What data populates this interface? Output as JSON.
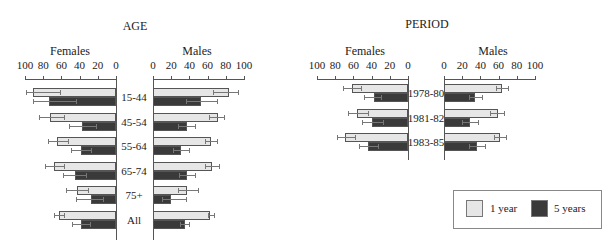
{
  "chart_data": [
    {
      "type": "bar",
      "orientation": "horizontal",
      "title": "AGE",
      "panels": [
        "Females",
        "Males"
      ],
      "categories": [
        "15-44",
        "45-54",
        "55-64",
        "65-74",
        "75+",
        "All"
      ],
      "xlim": [
        0,
        100
      ],
      "xticks": [
        0,
        20,
        40,
        60,
        80,
        100
      ],
      "series": [
        {
          "name": "1 year",
          "panel": "Females",
          "values": [
            91,
            73,
            65,
            68,
            43,
            63
          ],
          "err_low": [
            62,
            57,
            53,
            57,
            31,
            57
          ],
          "err_high": [
            99,
            85,
            75,
            78,
            55,
            68
          ]
        },
        {
          "name": "5 years",
          "panel": "Females",
          "values": [
            74,
            37,
            39,
            45,
            28,
            39
          ],
          "err_low": [
            44,
            22,
            28,
            33,
            14,
            29
          ],
          "err_high": [
            91,
            52,
            50,
            58,
            44,
            48
          ]
        },
        {
          "name": "1 year",
          "panel": "Males",
          "values": [
            83,
            71,
            64,
            65,
            37,
            63
          ],
          "err_low": [
            66,
            61,
            57,
            57,
            27,
            60
          ],
          "err_high": [
            93,
            78,
            70,
            72,
            49,
            67
          ]
        },
        {
          "name": "5 years",
          "panel": "Males",
          "values": [
            53,
            37,
            31,
            37,
            20,
            35
          ],
          "err_low": [
            36,
            28,
            22,
            29,
            10,
            30
          ],
          "err_high": [
            70,
            46,
            40,
            46,
            36,
            40
          ]
        }
      ]
    },
    {
      "type": "bar",
      "orientation": "horizontal",
      "title": "PERIOD",
      "panels": [
        "Females",
        "Males"
      ],
      "categories": [
        "1978-80",
        "1981-82",
        "1983-85"
      ],
      "xlim": [
        0,
        100
      ],
      "xticks": [
        0,
        20,
        40,
        60,
        80,
        100
      ],
      "series": [
        {
          "name": "1 year",
          "panel": "Females",
          "values": [
            61,
            56,
            69
          ],
          "err_low": [
            52,
            44,
            58
          ],
          "err_high": [
            71,
            66,
            78
          ]
        },
        {
          "name": "5 years",
          "panel": "Females",
          "values": [
            37,
            40,
            44
          ],
          "err_low": [
            30,
            28,
            33
          ],
          "err_high": [
            48,
            51,
            54
          ]
        },
        {
          "name": "1 year",
          "panel": "Males",
          "values": [
            64,
            59,
            62
          ],
          "err_low": [
            57,
            51,
            55
          ],
          "err_high": [
            70,
            66,
            68
          ]
        },
        {
          "name": "5 years",
          "panel": "Males",
          "values": [
            34,
            29,
            36
          ],
          "err_low": [
            27,
            20,
            28
          ],
          "err_high": [
            42,
            37,
            45
          ]
        }
      ]
    }
  ],
  "labels": {
    "age_title": "AGE",
    "period_title": "PERIOD",
    "females": "Females",
    "males": "Males",
    "ticks_female": [
      "100",
      "80",
      "60",
      "40",
      "20",
      "0"
    ],
    "ticks_male": [
      "0",
      "20",
      "40",
      "60",
      "80",
      "100"
    ]
  },
  "legend": {
    "items": [
      {
        "label": "1 year",
        "color": "#e6e6e6"
      },
      {
        "label": "5 years",
        "color": "#3a3a3a"
      }
    ]
  }
}
